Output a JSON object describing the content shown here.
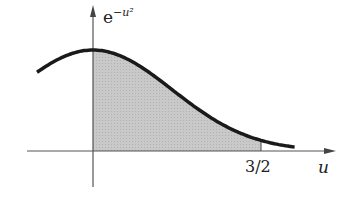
{
  "figure": {
    "function": "e^{-u^2}",
    "y_label_base": "e",
    "y_label_exp": "−u²",
    "x_label": "u",
    "tick_label": "3/2",
    "shaded_from": 0,
    "shaded_to": 1.5,
    "curve_domain": [
      -0.5,
      1.8
    ],
    "curve_color": "#1a1a1a",
    "shade_color": "#c8c8c8",
    "axis_color": "#555555"
  }
}
